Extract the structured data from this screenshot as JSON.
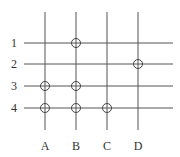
{
  "diagram": {
    "type": "grid-with-markers",
    "columns": [
      {
        "label": "A",
        "x": 45
      },
      {
        "label": "B",
        "x": 76
      },
      {
        "label": "C",
        "x": 107
      },
      {
        "label": "D",
        "x": 138
      }
    ],
    "rows": [
      {
        "label": "1",
        "y": 43
      },
      {
        "label": "2",
        "y": 64
      },
      {
        "label": "3",
        "y": 86
      },
      {
        "label": "4",
        "y": 108
      }
    ],
    "markers": [
      {
        "col": "B",
        "row": "1"
      },
      {
        "col": "D",
        "row": "2"
      },
      {
        "col": "A",
        "row": "3"
      },
      {
        "col": "B",
        "row": "3"
      },
      {
        "col": "A",
        "row": "4"
      },
      {
        "col": "B",
        "row": "4"
      },
      {
        "col": "C",
        "row": "4"
      }
    ],
    "line_color": "#555555",
    "marker_color": "#444444",
    "label_color": "#333333",
    "hline_x_start": 24,
    "hline_x_end": 173,
    "vline_y_start": 12,
    "vline_y_end": 130,
    "marker_radius": 4.5
  }
}
